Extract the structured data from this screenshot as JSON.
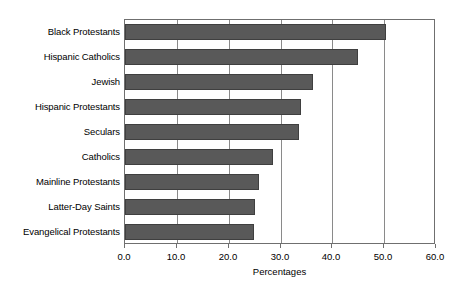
{
  "chart_data": {
    "type": "bar",
    "orientation": "horizontal",
    "title": "",
    "xlabel": "Percentages",
    "ylabel": "",
    "xlim": [
      0.0,
      60.0
    ],
    "xticks": [
      "0.0",
      "10.0",
      "20.0",
      "30.0",
      "40.0",
      "50.0",
      "60.0"
    ],
    "xtick_values": [
      0.0,
      10.0,
      20.0,
      30.0,
      40.0,
      50.0,
      60.0
    ],
    "grid": "vertical",
    "legend": "none",
    "bar_color": "#595959",
    "bar_edge_color": "#3f3f3f",
    "frame_color": "#6f6f6f",
    "gridline_color": "#8a8a8a",
    "categories": [
      "Black Protestants",
      "Hispanic Catholics",
      "Jewish",
      "Hispanic Protestants",
      "Seculars",
      "Catholics",
      "Mainline Protestants",
      "Latter-Day Saints",
      "Evangelical Protestants"
    ],
    "values": [
      50.3,
      45.0,
      36.3,
      34.0,
      33.6,
      28.5,
      25.8,
      25.0,
      24.8
    ]
  }
}
